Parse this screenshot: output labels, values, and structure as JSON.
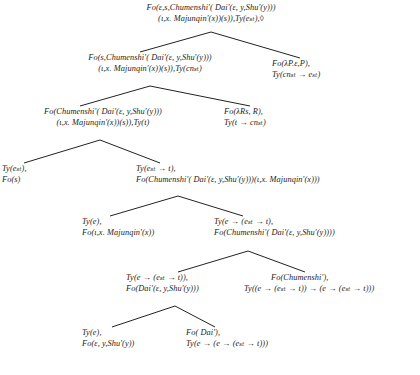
{
  "figure": {
    "type": "parse-tree",
    "font_style": "italic-serif",
    "ink_color": "#1b1b1b"
  },
  "nodes": [
    {
      "id": "root",
      "name": "node-root",
      "lines": [
        "Fo(ε,s,Chumenshi'( Dai'(ε, y,Shu'(y)))",
        "(ι,x. Majunqin'(x))(s)),Ty(eₛₜ),◊"
      ]
    },
    {
      "id": "n2-left",
      "name": "node-level2-left",
      "lines": [
        "Fo(s,Chumenshi'( Dai'(ε, y,Shu'(y)))",
        "(ι,x. Majunqin'(x))(s)),Ty(cnₛₜ)"
      ]
    },
    {
      "id": "n2-right",
      "name": "node-level2-right",
      "lines": [
        "Fo(λP.ε,P),",
        "Ty(cnₛₜ → eₛₜ)"
      ]
    },
    {
      "id": "n3-left",
      "name": "node-level3-left",
      "lines": [
        "Fo(Chumenshi'( Dai'(ε, y,Shu'(y)))",
        "(ι,x. Majunqin'(x))(s)),Ty(t)"
      ]
    },
    {
      "id": "n3-right",
      "name": "node-level3-right",
      "lines": [
        "Fo(λRs, R),",
        "Ty(t → cnₛₜ)"
      ]
    },
    {
      "id": "n4-left",
      "name": "node-level4-left",
      "lines": [
        "Ty(eₛₜ),",
        "Fo(s)"
      ]
    },
    {
      "id": "n4-right",
      "name": "node-level4-right",
      "lines": [
        "Ty(eₛₜ → t),",
        "Fo(Chumenshi'( Dai'(ε, y,Shu'(y)))(ι,x. Majunqin'(x)))"
      ]
    },
    {
      "id": "n5-left",
      "name": "node-level5-left",
      "lines": [
        "Ty(e),",
        "Fo(ι,x. Majunqin'(x))"
      ]
    },
    {
      "id": "n5-right",
      "name": "node-level5-right",
      "lines": [
        "Ty(e → (eₛₜ → t),",
        "Fo(Chumenshi'( Dai'(ε, y,Shu'(y))))"
      ]
    },
    {
      "id": "n6-left",
      "name": "node-level6-left",
      "lines": [
        "Ty(e → (eₛₜ → t)),",
        "Fo(Dai'(ε, y,Shu'(y)))"
      ]
    },
    {
      "id": "n6-right",
      "name": "node-level6-right",
      "lines": [
        "Fo(Chumenshi'),",
        "Ty((e → (eₛₜ → t)) → (e → (eₛₜ → t)))"
      ]
    },
    {
      "id": "n7-left",
      "name": "node-level7-left",
      "lines": [
        "Ty(e),",
        "Fo(ε, y,Shu'(y))"
      ]
    },
    {
      "id": "n7-right",
      "name": "node-level7-right",
      "lines": [
        "Fo( Dai'),",
        "Ty(e → (e → (eₛₜ → t)))"
      ]
    }
  ],
  "symbols": {
    "pointer": "◊",
    "arrow": "→",
    "lambda": "λ",
    "epsilon": "ε",
    "iota": "ι",
    "subscript_st": "st"
  }
}
